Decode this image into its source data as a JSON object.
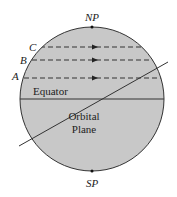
{
  "diagram": {
    "poles": {
      "north": "NP",
      "south": "SP"
    },
    "latitude_labels": [
      "C",
      "B",
      "A"
    ],
    "equator_label": "Equator",
    "orbital_plane_label": [
      "Orbital",
      "Plane"
    ],
    "colors": {
      "sphere_fill": "#c8c8c8",
      "stroke": "#333333"
    }
  }
}
